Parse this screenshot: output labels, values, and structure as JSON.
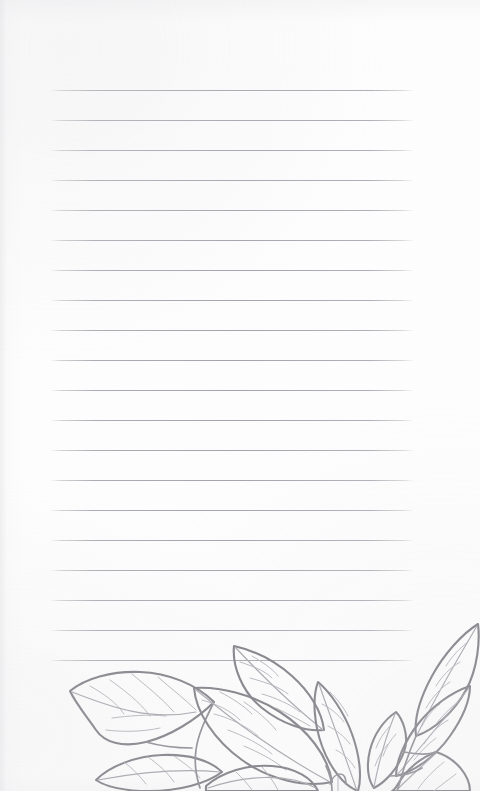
{
  "document": {
    "type": "lined-notebook-page",
    "title": "Blank ruled notebook page with botanical leaf illustration",
    "page_width": 480,
    "page_height": 791,
    "background_color": "#fdfdfd",
    "text_content": ""
  },
  "ruling": {
    "line_color": "#a4a4ac",
    "line_count": 20,
    "line_spacing": 30,
    "first_line_y": 90,
    "left_margin_x": 50,
    "right_margin_x": 414,
    "line_width": 364,
    "y_positions": [
      90,
      120,
      150,
      180,
      210,
      240,
      270,
      300,
      330,
      360,
      390,
      420,
      450,
      480,
      510,
      540,
      570,
      600,
      630,
      660
    ]
  },
  "artwork": {
    "name": "leaf-border-illustration",
    "style": "hand-drawn line art",
    "subject": "leaves and stems",
    "ink_color": "#7d7d84",
    "vein_color": "#a3a3aa",
    "position": "bottom",
    "region": {
      "x": 0,
      "y": 616,
      "width": 480,
      "height": 175
    },
    "clusters": [
      {
        "name": "left-leaf-cluster",
        "leaf_count": 3
      },
      {
        "name": "center-leaf-cluster",
        "leaf_count": 4
      },
      {
        "name": "right-leaf-cluster",
        "leaf_count": 5
      }
    ]
  }
}
